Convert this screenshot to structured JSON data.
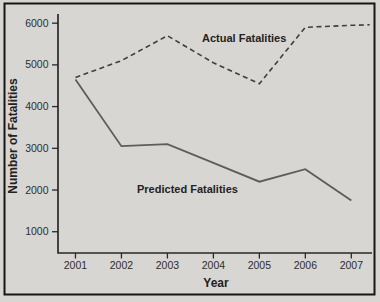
{
  "figure": {
    "background_color": "#d8d6d3",
    "frame_color": "#161616",
    "axis_color": "#2a2927",
    "text_color": "#232220"
  },
  "chart_data": {
    "type": "line",
    "title": "",
    "xlabel": "Year",
    "ylabel": "Number of Fatalities",
    "x": [
      2001,
      2002,
      2003,
      2004,
      2005,
      2006,
      2007
    ],
    "x_tick_labels": [
      "2001",
      "2002",
      "2003",
      "2004",
      "2005",
      "2006",
      "2007"
    ],
    "y_ticks": [
      1000,
      2000,
      3000,
      4000,
      5000,
      6000
    ],
    "y_tick_labels": [
      "1000",
      "2000",
      "3000",
      "4000",
      "5000",
      "6000"
    ],
    "xlim": [
      2000.62,
      2007.45
    ],
    "ylim": [
      490,
      6220
    ],
    "grid": false,
    "legend": "inline text annotations beside each line",
    "series": [
      {
        "name": "Actual Fatalities",
        "style": "dashed",
        "color": "#403f3d",
        "x": [
          2001,
          2002,
          2003,
          2004,
          2005,
          2006,
          2007,
          2007.4
        ],
        "values": [
          4700,
          5100,
          5700,
          5050,
          4550,
          5900,
          5950,
          5960
        ]
      },
      {
        "name": "Predicted Fatalities",
        "style": "solid",
        "color": "#5d5c5a",
        "x": [
          2001,
          2002,
          2003,
          2004,
          2005,
          2006,
          2007
        ],
        "values": [
          4650,
          3050,
          3100,
          2650,
          2200,
          2500,
          1750
        ]
      }
    ]
  }
}
